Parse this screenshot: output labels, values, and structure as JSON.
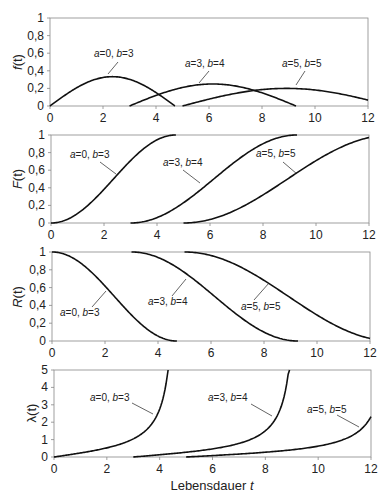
{
  "chart_data": [
    {
      "type": "line",
      "title": "",
      "ylabel": "f(t)",
      "xlabel": "",
      "xlim": [
        0,
        12
      ],
      "ylim": [
        0,
        1
      ],
      "xticks": [
        "0",
        "2",
        "4",
        "6",
        "8",
        "10",
        "12"
      ],
      "yticks": [
        "0",
        "0,2",
        "0,4",
        "0,6",
        "0,8",
        "1"
      ],
      "grid": false,
      "series": [
        {
          "name": "a=0, b=3",
          "a": 0,
          "b": 3,
          "x": [
            0,
            1,
            2,
            2.36,
            3,
            4,
            4.71
          ],
          "values": [
            0,
            0.21,
            0.32,
            0.333,
            0.32,
            0.15,
            0
          ]
        },
        {
          "name": "a=3, b=4",
          "a": 3,
          "b": 4,
          "x": [
            3,
            4,
            5,
            6,
            6.14,
            7,
            8,
            9,
            9.28
          ],
          "values": [
            0,
            0.12,
            0.21,
            0.25,
            0.25,
            0.23,
            0.15,
            0.03,
            0
          ]
        },
        {
          "name": "a=5, b=5",
          "a": 5,
          "b": 5,
          "x": [
            5,
            6,
            7,
            8,
            8.93,
            10,
            11,
            12
          ],
          "values": [
            0,
            0.08,
            0.14,
            0.19,
            0.2,
            0.18,
            0.14,
            0.09
          ]
        }
      ],
      "annotations": [
        {
          "text_a": "a",
          "text_mid": "=0, ",
          "text_b": "b",
          "text_end": "=3"
        },
        {
          "text_a": "a",
          "text_mid": "=3, ",
          "text_b": "b",
          "text_end": "=4"
        },
        {
          "text_a": "a",
          "text_mid": "=5, ",
          "text_b": "b",
          "text_end": "=5"
        }
      ]
    },
    {
      "type": "line",
      "title": "",
      "ylabel": "F(t)",
      "xlabel": "",
      "xlim": [
        0,
        12
      ],
      "ylim": [
        0,
        1
      ],
      "xticks": [
        "0",
        "2",
        "4",
        "6",
        "8",
        "10",
        "12"
      ],
      "yticks": [
        "0",
        "0,2",
        "0,4",
        "0,6",
        "0,8",
        "1"
      ],
      "grid": false,
      "series": [
        {
          "name": "a=0, b=3",
          "x": [
            0,
            1,
            2,
            3,
            4,
            4.71
          ],
          "values": [
            0,
            0.11,
            0.4,
            0.71,
            0.97,
            1
          ]
        },
        {
          "name": "a=3, b=4",
          "x": [
            3,
            4,
            5,
            6,
            7,
            8,
            9,
            9.28
          ],
          "values": [
            0,
            0.06,
            0.23,
            0.46,
            0.71,
            0.9,
            0.99,
            1
          ]
        },
        {
          "name": "a=5, b=5",
          "x": [
            5,
            6,
            7,
            8,
            9,
            10,
            11,
            12
          ],
          "values": [
            0,
            0.04,
            0.15,
            0.32,
            0.5,
            0.71,
            0.87,
            0.96
          ]
        }
      ]
    },
    {
      "type": "line",
      "title": "",
      "ylabel": "R(t)",
      "xlabel": "",
      "xlim": [
        0,
        12
      ],
      "ylim": [
        0,
        1
      ],
      "xticks": [
        "0",
        "2",
        "4",
        "6",
        "8",
        "10",
        "12"
      ],
      "yticks": [
        "0",
        "0,2",
        "0,4",
        "0,6",
        "0,8",
        "1"
      ],
      "grid": false,
      "series": [
        {
          "name": "a=0, b=3",
          "x": [
            0,
            1,
            2,
            3,
            4,
            4.71
          ],
          "values": [
            1,
            0.89,
            0.6,
            0.29,
            0.03,
            0
          ]
        },
        {
          "name": "a=3, b=4",
          "x": [
            3,
            4,
            5,
            6,
            7,
            8,
            9,
            9.28
          ],
          "values": [
            1,
            0.94,
            0.77,
            0.54,
            0.29,
            0.1,
            0.01,
            0
          ]
        },
        {
          "name": "a=5, b=5",
          "x": [
            5,
            6,
            7,
            8,
            9,
            10,
            11,
            12
          ],
          "values": [
            1,
            0.96,
            0.85,
            0.68,
            0.5,
            0.29,
            0.13,
            0.04
          ]
        }
      ]
    },
    {
      "type": "line",
      "title": "",
      "ylabel": "λ(t)",
      "xlabel": "Lebensdauer t",
      "xlim": [
        0,
        12
      ],
      "ylim": [
        0,
        5
      ],
      "xticks": [
        "0",
        "2",
        "4",
        "6",
        "8",
        "10",
        "12"
      ],
      "yticks": [
        "0",
        "1",
        "2",
        "3",
        "4",
        "5"
      ],
      "grid": false,
      "series": [
        {
          "name": "a=0, b=3",
          "x": [
            0,
            1,
            2,
            3,
            3.5,
            4,
            4.3
          ],
          "values": [
            0,
            0.23,
            0.53,
            1.1,
            1.6,
            2.8,
            5
          ]
        },
        {
          "name": "a=3, b=4",
          "x": [
            3,
            4,
            5,
            6,
            7,
            8,
            8.5,
            8.9
          ],
          "values": [
            0,
            0.13,
            0.27,
            0.46,
            0.76,
            1.5,
            2.4,
            5
          ]
        },
        {
          "name": "a=5, b=5",
          "x": [
            5,
            6,
            7,
            8,
            9,
            10,
            11,
            12
          ],
          "values": [
            0,
            0.08,
            0.17,
            0.27,
            0.4,
            0.6,
            1.0,
            2.3
          ]
        }
      ]
    }
  ],
  "panels": [
    {
      "ylabel_main": "f",
      "ylabel_arg": "(t)"
    },
    {
      "ylabel_main": "F",
      "ylabel_arg": "(t)"
    },
    {
      "ylabel_main": "R",
      "ylabel_arg": "(t)"
    },
    {
      "ylabel_main": "λ",
      "ylabel_arg": "(t)"
    }
  ],
  "xaxis_label": {
    "text": "Lebensdauer ",
    "var": "t"
  },
  "ticks": {
    "x": [
      "0",
      "2",
      "4",
      "6",
      "8",
      "10",
      "12"
    ],
    "y_prob": [
      "0",
      "0,2",
      "0,4",
      "0,6",
      "0,8",
      "1"
    ],
    "y_hazard": [
      "0",
      "1",
      "2",
      "3",
      "4",
      "5"
    ]
  },
  "labels": {
    "a0b3": {
      "a": "a",
      "eq1": "=0, ",
      "b": "b",
      "eq2": "=3"
    },
    "a3b4": {
      "a": "a",
      "eq1": "=3, ",
      "b": "b",
      "eq2": "=4"
    },
    "a5b5": {
      "a": "a",
      "eq1": "=5, ",
      "b": "b",
      "eq2": "=5"
    }
  }
}
